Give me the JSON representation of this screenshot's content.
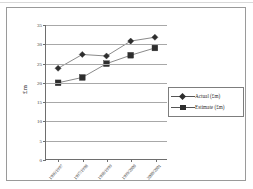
{
  "chart_data": {
    "type": "line",
    "title": "",
    "xlabel": "",
    "ylabel": "£m",
    "ylim": [
      0,
      35
    ],
    "yticks": [
      0,
      5,
      10,
      15,
      20,
      25,
      30,
      35
    ],
    "grid": true,
    "legend_position": "inside-right",
    "categories": [
      "1996/1997",
      "1997/1998",
      "1998/1999",
      "1999/2000",
      "2000/2001"
    ],
    "series": [
      {
        "name": "Actual (£m)",
        "marker": "diamond",
        "values": [
          23.7,
          27.3,
          26.9,
          30.8,
          31.8
        ]
      },
      {
        "name": "Estimate (£m)",
        "marker": "square",
        "values": [
          19.9,
          21.3,
          24.9,
          27.1,
          29.0
        ]
      }
    ]
  },
  "colors": {
    "line": "#555555",
    "marker": "#2e2e2e",
    "gridline": "#a8a8a8",
    "axis": "#6e6e6e",
    "frame": "#9a9a9a",
    "background": "#ffffff"
  }
}
